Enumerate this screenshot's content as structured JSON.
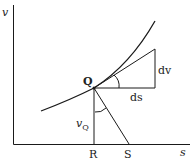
{
  "diagram": {
    "axes": {
      "y_label": "v",
      "x_label": "s"
    },
    "points": {
      "Q": "Q",
      "R": "R",
      "S": "S"
    },
    "labels": {
      "dv": "dv",
      "ds": "ds",
      "vQ_main": "v",
      "vQ_sub": "Q"
    },
    "colors": {
      "stroke": "#1a1a1a",
      "background": "#ffffff"
    }
  }
}
